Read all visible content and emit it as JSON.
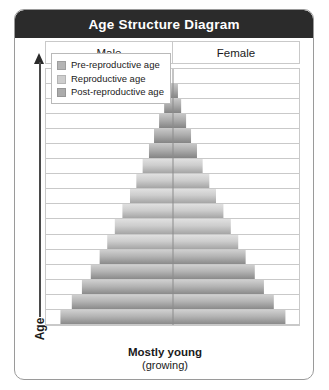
{
  "card": {
    "title": "Age Structure Diagram"
  },
  "axis": {
    "y_label": "Age",
    "arrow_icon": "up-arrow-icon"
  },
  "columns": {
    "male": "Male",
    "female": "Female"
  },
  "legend": {
    "items": [
      {
        "label": "Pre-reproductive age",
        "color": "#b4b4b4",
        "key": "pre"
      },
      {
        "label": "Reproductive age",
        "color": "#cdcdcd",
        "key": "rep"
      },
      {
        "label": "Post-reproductive age",
        "color": "#ababab",
        "key": "post"
      }
    ]
  },
  "caption": {
    "main": "Mostly young",
    "sub": "(growing)"
  },
  "chart_data": {
    "type": "bar",
    "subtype": "population-pyramid",
    "title": "Age Structure Diagram",
    "xlabel": "",
    "ylabel": "Age",
    "grid": true,
    "legend_position": "top-left",
    "orientation": "horizontal-mirrored",
    "categories": [
      "row-17",
      "row-16",
      "row-15",
      "row-14",
      "row-13",
      "row-12",
      "row-11",
      "row-10",
      "row-9",
      "row-8",
      "row-7",
      "row-6",
      "row-5",
      "row-4",
      "row-3",
      "row-2",
      "row-1"
    ],
    "note": "Widths are percent of full plot width, symmetric about the center line. Row 17 is the oldest (top), row 1 the youngest (bottom).",
    "series": [
      {
        "name": "Population width (% of plot)",
        "values": [
          0,
          4,
          7,
          11,
          15,
          19,
          24,
          29,
          34,
          40,
          46,
          52,
          58,
          65,
          72,
          80,
          89
        ]
      }
    ],
    "stage_by_row": [
      "post",
      "post",
      "post",
      "post",
      "post",
      "post",
      "rep",
      "rep",
      "rep",
      "rep",
      "rep",
      "rep",
      "pre",
      "pre",
      "pre",
      "pre",
      "pre"
    ],
    "ylim": [
      0,
      17
    ],
    "xlim": [
      -100,
      100
    ]
  }
}
